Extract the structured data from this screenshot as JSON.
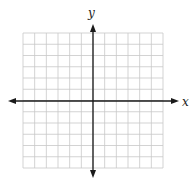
{
  "diagram": {
    "type": "coordinate-plane",
    "x_axis_label": "x",
    "y_axis_label": "y",
    "grid": {
      "columns": 12,
      "rows": 12,
      "left": 23,
      "right": 163,
      "top": 33,
      "bottom": 168,
      "origin_x": 93,
      "origin_y": 101,
      "line_color": "#c8c8c8",
      "axis_color": "#1a1a1a"
    },
    "x_axis_extent": {
      "start": 8,
      "end": 179
    },
    "y_axis_extent": {
      "start": 24,
      "end": 178
    }
  }
}
